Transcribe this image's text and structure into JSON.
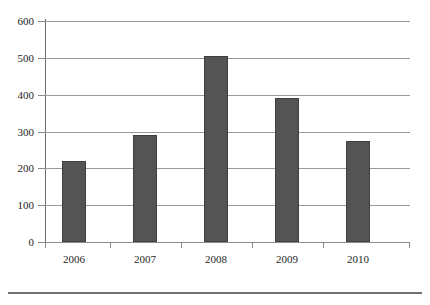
{
  "figure": {
    "caption_remnant": "",
    "bar_color": "#545454",
    "bar_edge_color": "#3f3f3f",
    "grid_color": "#9a9a9a",
    "axis_color": "#6d6d6d",
    "rule_color": "#6f6f6f",
    "background": "#ffffff"
  },
  "chart_data": {
    "type": "bar",
    "title": "",
    "xlabel": "",
    "ylabel": "",
    "categories": [
      "2006",
      "2007",
      "2008",
      "2009",
      "2010"
    ],
    "values": [
      220,
      290,
      505,
      390,
      275
    ],
    "series": [
      {
        "name": "",
        "values": [
          220,
          290,
          505,
          390,
          275
        ]
      }
    ],
    "ylim": [
      0,
      600
    ],
    "yticks": [
      0,
      100,
      200,
      300,
      400,
      500,
      600
    ],
    "ytick_labels": [
      "0",
      "100",
      "200",
      "300",
      "400",
      "500",
      "600"
    ],
    "xtick_labels": [
      "2006",
      "2007",
      "2008",
      "2009",
      "2010"
    ],
    "grid": true,
    "grid_axis": "y",
    "legend": false,
    "legend_position": "none",
    "annotations": []
  }
}
